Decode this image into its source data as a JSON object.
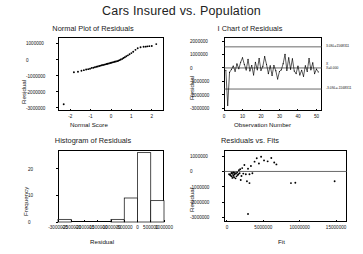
{
  "figure": {
    "title": "Cars Insured vs. Population",
    "software_style": "minitab-residual-diagnostics"
  },
  "chart_data": [
    {
      "type": "scatter",
      "panel": "top-left",
      "title": "Normal Plot of Residuals",
      "xlabel": "Normal Score",
      "ylabel": "Residual",
      "xlim": [
        -2.6,
        2.6
      ],
      "ylim": [
        -3200000,
        1400000
      ],
      "xticks": [
        -2,
        -1,
        0,
        1,
        2
      ],
      "yticks": [
        1000000,
        0,
        -1000000,
        -2000000,
        -3000000
      ],
      "ytick_labels": [
        "1000000",
        "0",
        "-1000000",
        "-2000000",
        "-3000000"
      ],
      "grid": false,
      "x": [
        -2.32,
        -1.82,
        -1.62,
        -1.45,
        -1.33,
        -1.22,
        -1.12,
        -1.03,
        -0.95,
        -0.87,
        -0.79,
        -0.72,
        -0.65,
        -0.58,
        -0.52,
        -0.45,
        -0.39,
        -0.33,
        -0.27,
        -0.21,
        -0.16,
        -0.1,
        -0.04,
        0.01,
        0.07,
        0.13,
        0.18,
        0.24,
        0.3,
        0.36,
        0.42,
        0.48,
        0.55,
        0.61,
        0.68,
        0.75,
        0.83,
        0.91,
        1.0,
        1.09,
        1.2,
        1.31,
        1.45,
        1.6,
        1.7,
        1.78,
        1.88,
        2.0,
        2.22
      ],
      "y": [
        -2780000,
        -790000,
        -760000,
        -700000,
        -660000,
        -620000,
        -600000,
        -570000,
        -520000,
        -510000,
        -480000,
        -450000,
        -430000,
        -400000,
        -380000,
        -360000,
        -340000,
        -320000,
        -300000,
        -280000,
        -260000,
        -240000,
        -220000,
        -200000,
        -180000,
        -160000,
        -140000,
        -120000,
        -100000,
        -80000,
        -40000,
        0,
        40000,
        90000,
        140000,
        200000,
        260000,
        330000,
        400000,
        480000,
        600000,
        700000,
        760000,
        790000,
        800000,
        820000,
        830000,
        840000,
        960000
      ]
    },
    {
      "type": "line",
      "panel": "top-right",
      "title": "I Chart of Residuals",
      "xlabel": "Observation Number",
      "ylabel": "Residual",
      "xlim": [
        0,
        53
      ],
      "ylim": [
        -3200000,
        2300000
      ],
      "xticks": [
        0,
        10,
        20,
        30,
        40,
        50
      ],
      "yticks": [
        2000000,
        1000000,
        0,
        -1000000,
        -2000000,
        -3000000
      ],
      "ytick_labels": [
        "2000000",
        "1000000",
        "0",
        "-1000000",
        "-2000000",
        "-3000000"
      ],
      "grid": false,
      "control_limits": {
        "ucl_value": 1568311,
        "ucl_label": "3.0SL=1568311",
        "center_value": 0,
        "center_label_line1": "X",
        "center_label_line2": "X=0.000",
        "lcl_value": -1568311,
        "lcl_label": "-3.0SL=-1568311"
      },
      "x": [
        1,
        2,
        3,
        4,
        5,
        6,
        7,
        8,
        9,
        10,
        11,
        12,
        13,
        14,
        15,
        16,
        17,
        18,
        19,
        20,
        21,
        22,
        23,
        24,
        25,
        26,
        27,
        28,
        29,
        30,
        31,
        32,
        33,
        34,
        35,
        36,
        37,
        38,
        39,
        40,
        41,
        42,
        43,
        44,
        45,
        46,
        47,
        48,
        49,
        50,
        51
      ],
      "y": [
        -180000,
        -2780000,
        -330000,
        -120000,
        150000,
        -250000,
        300000,
        -60000,
        420000,
        760000,
        260000,
        -150000,
        640000,
        -220000,
        180000,
        -520000,
        420000,
        -140000,
        700000,
        -180000,
        120000,
        840000,
        260000,
        -420000,
        160000,
        -560000,
        180000,
        -200000,
        -820000,
        -260000,
        -140000,
        320000,
        1020000,
        -180000,
        760000,
        -90000,
        680000,
        -230000,
        -420000,
        140000,
        -520000,
        -180000,
        -620000,
        160000,
        -260000,
        700000,
        -140000,
        380000,
        -420000,
        -90000,
        -300000
      ]
    },
    {
      "type": "bar",
      "panel": "bottom-left",
      "title": "Histogram of Residuals",
      "xlabel": "Residual",
      "ylabel": "Frequency",
      "ylim": [
        0,
        27
      ],
      "yticks": [
        0,
        10,
        20
      ],
      "ytick_labels": [
        "0",
        "10",
        "20"
      ],
      "xtick_labels": [
        "-3000000",
        "-2500000",
        "-2000000",
        "-1500000",
        "-1000000",
        "-500000",
        "0",
        "500000",
        "1000000"
      ],
      "grid": false,
      "bin_edges": [
        -3000000,
        -2500000,
        -2000000,
        -1500000,
        -1000000,
        -500000,
        0,
        500000,
        1000000
      ],
      "values": [
        1,
        0,
        0,
        0,
        1,
        9,
        26,
        8,
        5
      ]
    },
    {
      "type": "scatter",
      "panel": "bottom-right",
      "title": "Residuals vs. Fits",
      "xlabel": "Fit",
      "ylabel": "Residual",
      "xlim": [
        -400000,
        16500000
      ],
      "ylim": [
        -3300000,
        1400000
      ],
      "xticks": [
        0,
        5000000,
        10000000,
        15000000
      ],
      "xtick_labels": [
        "0",
        "5000000",
        "10000000",
        "15000000"
      ],
      "yticks": [
        1000000,
        0,
        -1000000,
        -2000000,
        -3000000
      ],
      "ytick_labels": [
        "1000000",
        "0",
        "-1000000",
        "-2000000",
        "-3000000"
      ],
      "grid": false,
      "reference_line_y": 0,
      "x": [
        300000,
        420000,
        520000,
        600000,
        650000,
        700000,
        760000,
        820000,
        880000,
        930000,
        980000,
        1050000,
        1100000,
        1180000,
        1250000,
        1320000,
        1400000,
        1480000,
        1560000,
        1650000,
        1740000,
        1820000,
        1900000,
        2000000,
        2100000,
        2250000,
        2400000,
        2600000,
        2750000,
        2900000,
        3100000,
        3300000,
        3500000,
        3800000,
        4100000,
        4400000,
        4700000,
        5100000,
        5600000,
        6100000,
        6500000,
        6800000,
        2900000,
        3100000,
        8800000,
        9400000,
        14800000
      ],
      "y": [
        -180000,
        -220000,
        -260000,
        -120000,
        -320000,
        -80000,
        -420000,
        -160000,
        -280000,
        -60000,
        -380000,
        -200000,
        -100000,
        -450000,
        -140000,
        -320000,
        -60000,
        -240000,
        -180000,
        80000,
        -120000,
        140000,
        -560000,
        -300000,
        220000,
        -140000,
        420000,
        -180000,
        -640000,
        180000,
        -760000,
        360000,
        -120000,
        640000,
        860000,
        520000,
        960000,
        720000,
        660000,
        880000,
        580000,
        460000,
        -2780000,
        -180000,
        -760000,
        -740000,
        -640000
      ]
    }
  ]
}
